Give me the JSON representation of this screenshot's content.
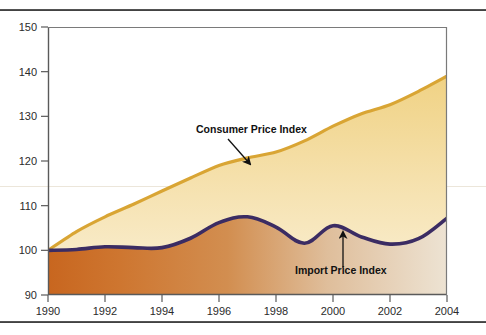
{
  "figure": {
    "background": "#ffffff",
    "top_rule": "top-divider-rule",
    "bottom_rule": "bottom-divider-rule"
  },
  "colors": {
    "cpi_line": "#D9A534",
    "cpi_fill_top": "#F2D98C",
    "cpi_fill_bottom": "#F7E9BE",
    "import_line": "#3B2C63",
    "import_fill_left": "#CC6E2A",
    "import_fill_right": "#EDE0CE",
    "axis": "#5a5a5a",
    "text": "#2b2b2b",
    "gridline": "#e8e2d4"
  },
  "chart_data": {
    "type": "area",
    "title": "",
    "subtitle": "",
    "xlabel": "",
    "ylabel": "",
    "xlim": [
      1990,
      2004
    ],
    "ylim": [
      90,
      150
    ],
    "grid": false,
    "legend_position": "inline-annotations",
    "x_ticks": [
      1990,
      1992,
      1994,
      1996,
      1998,
      2000,
      2002,
      2004
    ],
    "x_tick_labels": [
      "1990",
      "1992",
      "1994",
      "1996",
      "1998",
      "2000",
      "2002",
      "2004"
    ],
    "y_ticks": [
      90,
      100,
      110,
      120,
      130,
      140,
      150
    ],
    "y_tick_labels": [
      "90",
      "100",
      "110",
      "120",
      "130",
      "140",
      "150"
    ],
    "x": [
      1990,
      1991,
      1992,
      1993,
      1994,
      1995,
      1996,
      1997,
      1998,
      1999,
      2000,
      2001,
      2002,
      2003,
      2004
    ],
    "series": [
      {
        "name": "Consumer Price Index",
        "color": "#D9A534",
        "values": [
          100.0,
          104.2,
          107.5,
          110.3,
          113.3,
          116.2,
          119.0,
          120.7,
          122.0,
          124.5,
          127.8,
          130.6,
          132.6,
          135.6,
          139.0
        ]
      },
      {
        "name": "Import Price Index",
        "color": "#3B2C63",
        "values": [
          100.0,
          100.2,
          100.8,
          100.6,
          100.6,
          102.7,
          106.2,
          107.5,
          105.2,
          101.6,
          105.5,
          103.0,
          101.4,
          102.6,
          107.2
        ]
      }
    ],
    "annotations": [
      {
        "id": "cpi-annotation",
        "text": "Consumer Price Index",
        "label_x": 196,
        "label_y": 133,
        "pointer_kind": "diagonal-arrow",
        "pointer_from_x": 228,
        "pointer_from_y": 139,
        "pointer_to_x": 250,
        "pointer_to_y": 164
      },
      {
        "id": "import-annotation",
        "text": "Import Price Index",
        "label_x": 295,
        "label_y": 274,
        "pointer_kind": "up-arrow",
        "pointer_from_x": 343,
        "pointer_from_y": 268,
        "pointer_to_x": 343,
        "pointer_to_y": 232
      }
    ]
  }
}
